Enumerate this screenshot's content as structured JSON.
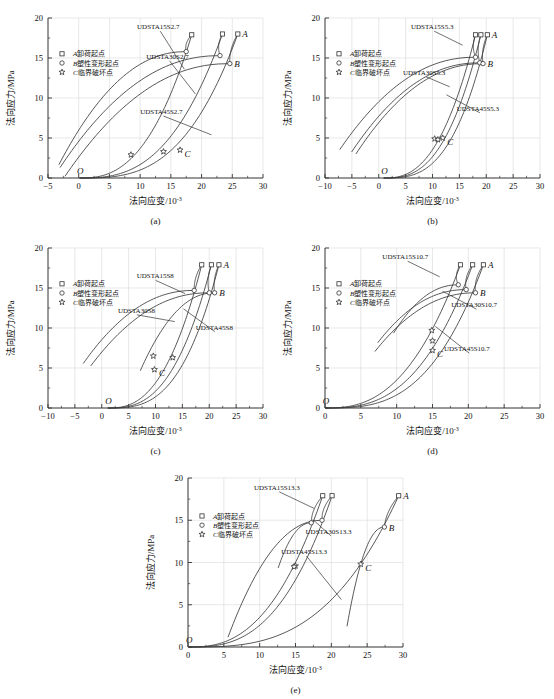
{
  "figure": {
    "background": "#ffffff",
    "axis_color": "#333333",
    "curve_color": "#3a3a3a",
    "grid_color": "#d8d8d8"
  },
  "common": {
    "xlabel_main": "法向应变/10",
    "xlabel_sup": "-3",
    "ylabel": "法向应力/MPa",
    "legend": [
      {
        "marker": "square",
        "italic": "A",
        "text": "卸荷起点"
      },
      {
        "marker": "circle",
        "italic": "B",
        "text": "塑性变形起点"
      },
      {
        "marker": "star",
        "italic": "C",
        "text": "临界破坏点"
      }
    ],
    "point_labels": {
      "A": "A",
      "B": "B",
      "C": "C",
      "O": "O"
    },
    "yticks": [
      0,
      5,
      10,
      15,
      20
    ]
  },
  "chart_data": [
    {
      "id": "a",
      "type": "line",
      "caption": "(a)",
      "title": "",
      "xlabel": "法向应变/10-3",
      "ylabel": "法向应力/MPa",
      "xlim": [
        -5,
        30
      ],
      "ylim": [
        0,
        20
      ],
      "xticks": [
        -5,
        0,
        5,
        10,
        15,
        20,
        25,
        30
      ],
      "yticks": [
        0,
        5,
        10,
        15,
        20
      ],
      "grid": true,
      "legend_position": "upper-left",
      "annotations": [
        {
          "text": "UDSTA15S2.7",
          "x": 9.5,
          "y": 18.6,
          "anchor_x": 17.2,
          "anchor_y": 13.6
        },
        {
          "text": "UDSTA30S2.7",
          "x": 11.0,
          "y": 14.9,
          "anchor_x": 19.0,
          "anchor_y": 10.5
        },
        {
          "text": "UDSTA45S2.7",
          "x": 10.0,
          "y": 8.0,
          "anchor_x": 21.6,
          "anchor_y": 5.4
        }
      ],
      "series": [
        {
          "name": "UDSTA15S2.7",
          "A": {
            "x": 18.4,
            "y": 17.9
          },
          "B": {
            "x": 17.5,
            "y": 15.8
          },
          "C": {
            "x": 8.5,
            "y": 2.9
          }
        },
        {
          "name": "UDSTA30S2.7",
          "A": {
            "x": 23.4,
            "y": 18.0
          },
          "B": {
            "x": 23.0,
            "y": 15.3
          },
          "C": {
            "x": 13.8,
            "y": 3.3
          }
        },
        {
          "name": "UDSTA45S2.7",
          "A": {
            "x": 25.9,
            "y": 18.0
          },
          "B": {
            "x": 24.6,
            "y": 14.3
          },
          "C": {
            "x": 16.5,
            "y": 3.5
          }
        }
      ]
    },
    {
      "id": "b",
      "type": "line",
      "caption": "(b)",
      "title": "",
      "xlabel": "法向应变/10-3",
      "ylabel": "法向应力/MPa",
      "xlim": [
        -10,
        30
      ],
      "ylim": [
        0,
        20
      ],
      "xticks": [
        -10,
        -5,
        0,
        5,
        10,
        15,
        20,
        25,
        30
      ],
      "yticks": [
        0,
        5,
        10,
        15,
        20
      ],
      "grid": true,
      "legend_position": "upper-left",
      "annotations": [
        {
          "text": "UDSTA15S5.3",
          "x": 6.0,
          "y": 18.6,
          "anchor_x": 15.6,
          "anchor_y": 16.6
        },
        {
          "text": "UDSTA30S5.3",
          "x": 4.5,
          "y": 12.9,
          "anchor_x": 13.2,
          "anchor_y": 11.4
        },
        {
          "text": "UDSTA45S5.3",
          "x": 14.5,
          "y": 8.4,
          "anchor_x": 12.6,
          "anchor_y": 10.4
        }
      ],
      "series": [
        {
          "name": "UDSTA15S5.3",
          "A": {
            "x": 18.0,
            "y": 17.9
          },
          "B": {
            "x": 18.0,
            "y": 15.1
          },
          "C": {
            "x": 10.4,
            "y": 4.9
          }
        },
        {
          "name": "UDSTA30S5.3",
          "A": {
            "x": 19.0,
            "y": 17.9
          },
          "B": {
            "x": 18.8,
            "y": 14.4
          },
          "C": {
            "x": 11.0,
            "y": 4.8
          }
        },
        {
          "name": "UDSTA45S5.3",
          "A": {
            "x": 20.2,
            "y": 17.9
          },
          "B": {
            "x": 19.4,
            "y": 14.3
          },
          "C": {
            "x": 11.9,
            "y": 5.0
          }
        }
      ]
    },
    {
      "id": "c",
      "type": "line",
      "caption": "(c)",
      "title": "",
      "xlabel": "法向应变/10-3",
      "ylabel": "法向应力/MPa",
      "xlim": [
        -10,
        30
      ],
      "ylim": [
        0,
        20
      ],
      "xticks": [
        -10,
        -5,
        0,
        5,
        10,
        15,
        20,
        25,
        30
      ],
      "yticks": [
        0,
        5,
        10,
        15,
        20
      ],
      "grid": true,
      "legend_position": "upper-left",
      "annotations": [
        {
          "text": "UDSTA15S8",
          "x": 6.5,
          "y": 16.2,
          "anchor_x": 15.5,
          "anchor_y": 14.3
        },
        {
          "text": "UDSTA30S8",
          "x": 3.0,
          "y": 11.9,
          "anchor_x": 13.6,
          "anchor_y": 10.8
        },
        {
          "text": "UDSTA45S8",
          "x": 17.5,
          "y": 9.8,
          "anchor_x": 15.2,
          "anchor_y": 12.4
        }
      ],
      "series": [
        {
          "name": "UDSTA15S8",
          "A": {
            "x": 18.6,
            "y": 17.9
          },
          "B": {
            "x": 17.2,
            "y": 14.7
          },
          "C": {
            "x": 9.6,
            "y": 6.5
          }
        },
        {
          "name": "UDSTA30S8",
          "A": {
            "x": 20.4,
            "y": 17.9
          },
          "B": {
            "x": 20.0,
            "y": 14.4
          },
          "C": {
            "x": 13.2,
            "y": 6.3
          }
        },
        {
          "name": "UDSTA45S8",
          "A": {
            "x": 21.8,
            "y": 17.9
          },
          "B": {
            "x": 21.0,
            "y": 14.4
          },
          "C": {
            "x": 9.8,
            "y": 4.8
          }
        }
      ]
    },
    {
      "id": "d",
      "type": "line",
      "caption": "(d)",
      "title": "",
      "xlabel": "法向应变/10-3",
      "ylabel": "法向应力/MPa",
      "xlim": [
        0,
        30
      ],
      "ylim": [
        0,
        20
      ],
      "xticks": [
        0,
        5,
        10,
        15,
        20,
        25,
        30
      ],
      "yticks": [
        0,
        5,
        10,
        15,
        20
      ],
      "grid": true,
      "legend_position": "upper-left",
      "annotations": [
        {
          "text": "UDSTA15S10.7",
          "x": 8.0,
          "y": 18.6,
          "anchor_x": 16.0,
          "anchor_y": 16.4
        },
        {
          "text": "UDSTA30S10.7",
          "x": 17.6,
          "y": 12.6,
          "anchor_x": 16.4,
          "anchor_y": 14.6
        },
        {
          "text": "UDSTA45S10.7",
          "x": 16.6,
          "y": 7.1,
          "anchor_x": 15.4,
          "anchor_y": 10.2
        }
      ],
      "series": [
        {
          "name": "UDSTA15S10.7",
          "A": {
            "x": 18.9,
            "y": 17.9
          },
          "B": {
            "x": 18.6,
            "y": 15.4
          },
          "C": {
            "x": 14.9,
            "y": 9.7
          }
        },
        {
          "name": "UDSTA30S10.7",
          "A": {
            "x": 20.6,
            "y": 17.9
          },
          "B": {
            "x": 19.7,
            "y": 14.8
          },
          "C": {
            "x": 15.0,
            "y": 8.4
          }
        },
        {
          "name": "UDSTA45S10.7",
          "A": {
            "x": 22.1,
            "y": 17.9
          },
          "B": {
            "x": 21.0,
            "y": 14.4
          },
          "C": {
            "x": 15.0,
            "y": 7.2
          }
        }
      ]
    },
    {
      "id": "e",
      "type": "line",
      "caption": "(e)",
      "title": "",
      "xlabel": "法向应变/10-3",
      "ylabel": "法向应力/MPa",
      "xlim": [
        0,
        30
      ],
      "ylim": [
        0,
        20
      ],
      "xticks": [
        0,
        5,
        10,
        15,
        20,
        25,
        30
      ],
      "yticks": [
        0,
        5,
        10,
        15,
        20
      ],
      "grid": true,
      "legend_position": "upper-left",
      "annotations": [
        {
          "text": "UDSTA15S13.3",
          "x": 9.2,
          "y": 18.6,
          "anchor_x": 17.6,
          "anchor_y": 16.4
        },
        {
          "text": "UDSTA30S13.3",
          "x": 16.4,
          "y": 13.4,
          "anchor_x": 17.4,
          "anchor_y": 15.1
        },
        {
          "text": "UDSTA45S13.3",
          "x": 13.0,
          "y": 11.0,
          "anchor_x": 21.4,
          "anchor_y": 5.6
        }
      ],
      "series": [
        {
          "name": "UDSTA15S13.3",
          "A": {
            "x": 18.8,
            "y": 17.9
          },
          "B": {
            "x": 17.2,
            "y": 14.7
          },
          "C": {
            "x": 15.0,
            "y": 9.6
          }
        },
        {
          "name": "UDSTA30S13.3",
          "A": {
            "x": 20.1,
            "y": 17.9
          },
          "B": {
            "x": 18.7,
            "y": 15.0
          },
          "C": {
            "x": 14.8,
            "y": 9.5
          }
        },
        {
          "name": "UDSTA45S13.3",
          "A": {
            "x": 29.4,
            "y": 17.9
          },
          "B": {
            "x": 27.4,
            "y": 14.2
          },
          "C": {
            "x": 24.1,
            "y": 9.8
          }
        }
      ]
    }
  ]
}
